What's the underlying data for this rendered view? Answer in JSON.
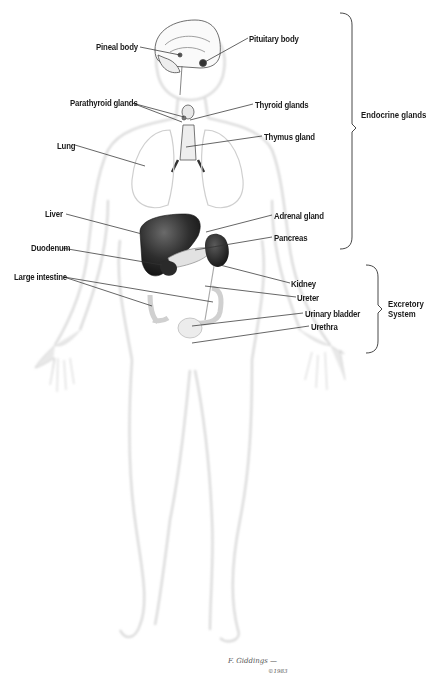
{
  "diagram": {
    "type": "anatomical-illustration",
    "labels": [
      {
        "id": "pineal-body",
        "text": "Pineal body",
        "x": 96,
        "y": 41,
        "target": [
          180,
          55
        ]
      },
      {
        "id": "pituitary-body",
        "text": "Pituitary body",
        "x": 249,
        "y": 33,
        "target": [
          203,
          63
        ]
      },
      {
        "id": "parathyroid-glands",
        "text": "Parathyroid glands",
        "x": 70,
        "y": 97,
        "target": [
          184,
          117
        ]
      },
      {
        "id": "thyroid-glands",
        "text": "Thyroid glands",
        "x": 255,
        "y": 99,
        "target": [
          190,
          120
        ]
      },
      {
        "id": "thymus-gland",
        "text": "Thymus gland",
        "x": 264,
        "y": 131,
        "target": [
          186,
          147
        ]
      },
      {
        "id": "lung",
        "text": "Lung",
        "x": 57,
        "y": 140,
        "target": [
          145,
          166
        ]
      },
      {
        "id": "liver",
        "text": "Liver",
        "x": 45,
        "y": 208,
        "target": [
          142,
          234
        ]
      },
      {
        "id": "adrenal-gland",
        "text": "Adrenal gland",
        "x": 274,
        "y": 210,
        "target": [
          206,
          232
        ]
      },
      {
        "id": "duodenum",
        "text": "Duodenum",
        "x": 31,
        "y": 242,
        "target": [
          162,
          265
        ]
      },
      {
        "id": "pancreas",
        "text": "Pancreas",
        "x": 274,
        "y": 232,
        "target": [
          195,
          250
        ]
      },
      {
        "id": "large-intestine",
        "text": "Large intestine",
        "x": 14,
        "y": 271,
        "targets": [
          [
            213,
            302
          ],
          [
            152,
            306
          ]
        ]
      },
      {
        "id": "kidney",
        "text": "Kidney",
        "x": 291,
        "y": 278,
        "target": [
          220,
          265
        ]
      },
      {
        "id": "ureter",
        "text": "Ureter",
        "x": 297,
        "y": 292,
        "target": [
          205,
          286
        ]
      },
      {
        "id": "urinary-bladder",
        "text": "Urinary bladder",
        "x": 305,
        "y": 308,
        "target": [
          192,
          326
        ]
      },
      {
        "id": "urethra",
        "text": "Urethra",
        "x": 311,
        "y": 321,
        "target": [
          192,
          343
        ]
      }
    ],
    "groups": [
      {
        "id": "endocrine-glands",
        "text": "Endocrine glands",
        "x": 361,
        "y": 109,
        "bracket": {
          "x": 345,
          "top": 13,
          "bottom": 249
        }
      },
      {
        "id": "excretory-system",
        "lines": [
          "Excretory",
          "System"
        ],
        "x": 395,
        "y": 298,
        "bracket": {
          "x": 370,
          "top": 265,
          "bottom": 353
        }
      }
    ],
    "signature": {
      "text": "F. Giddings —",
      "year": "©1983"
    },
    "colors": {
      "background": "#ffffff",
      "label_text": "#1a1a1a",
      "leader_line": "#333333",
      "body_outline": "#d6d6d6",
      "organ_dark": "#3a3a3a",
      "organ_light": "#e6e6e6"
    }
  }
}
